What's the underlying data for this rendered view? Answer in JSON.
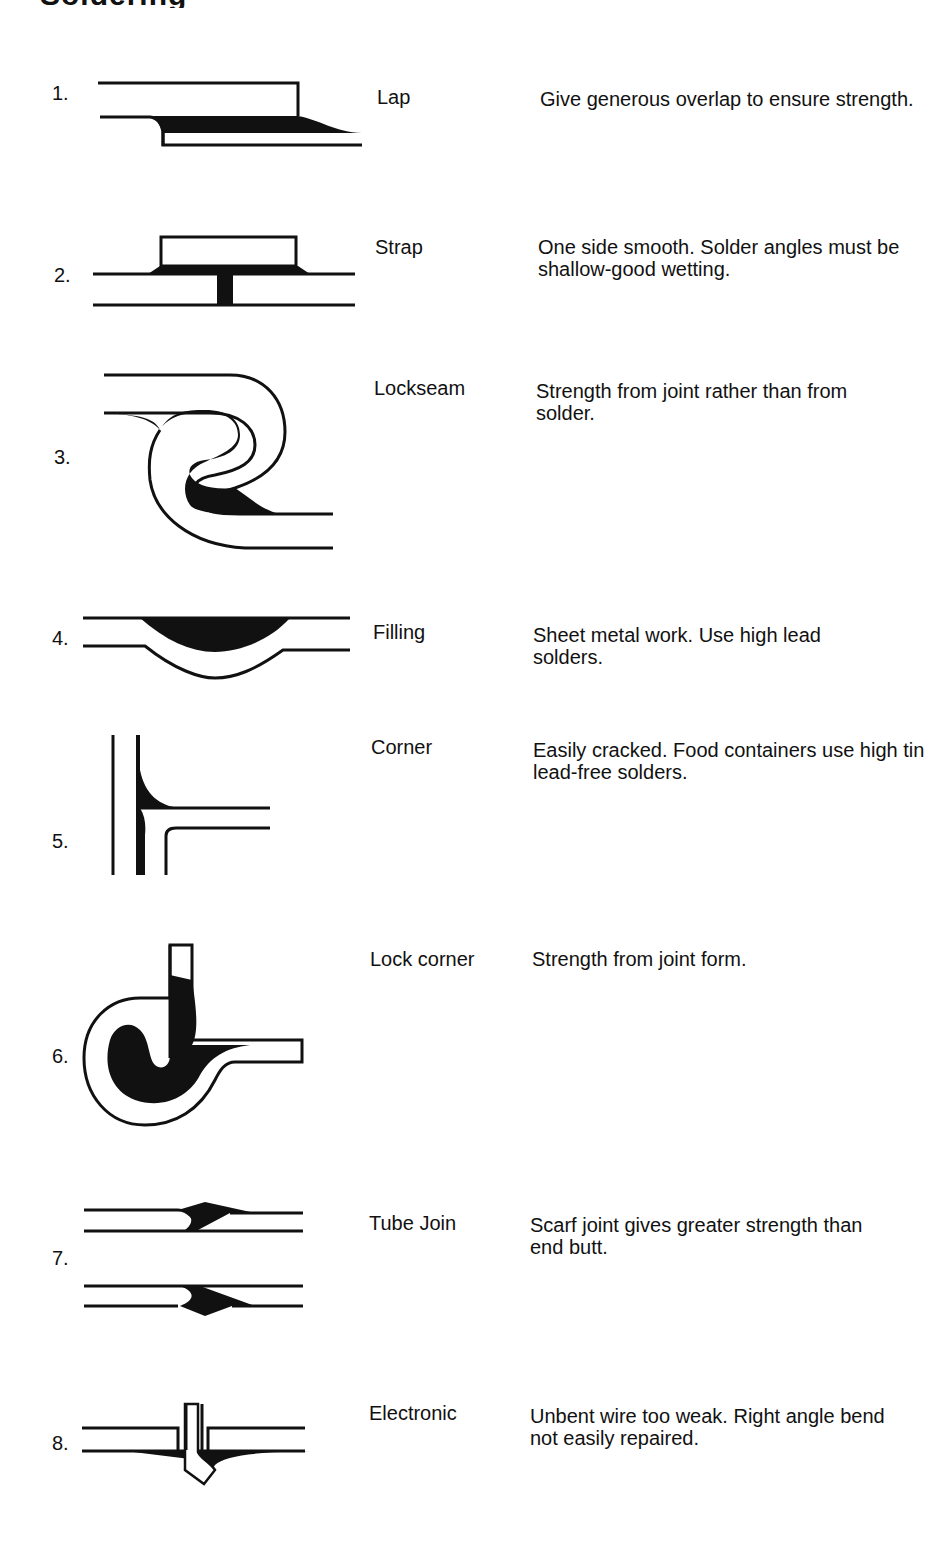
{
  "page": {
    "title_fragment": "Soldering"
  },
  "joints": [
    {
      "number": "1.",
      "name": "Lap",
      "description": "Give generous overlap to ensure strength.",
      "icon": "lap-joint-diagram"
    },
    {
      "number": "2.",
      "name": "Strap",
      "description": "One side smooth. Solder angles must be shallow-good wetting.",
      "icon": "strap-joint-diagram"
    },
    {
      "number": "3.",
      "name": "Lockseam",
      "description": "Strength from joint rather than from solder.",
      "icon": "lockseam-joint-diagram"
    },
    {
      "number": "4.",
      "name": "Filling",
      "description": "Sheet metal work. Use high lead solders.",
      "icon": "filling-joint-diagram"
    },
    {
      "number": "5.",
      "name": "Corner",
      "description": "Easily cracked. Food containers use high tin lead-free solders.",
      "icon": "corner-joint-diagram"
    },
    {
      "number": "6.",
      "name": "Lock corner",
      "description": "Strength from joint form.",
      "icon": "lock-corner-joint-diagram"
    },
    {
      "number": "7.",
      "name": "Tube Join",
      "description": "Scarf joint gives greater strength than end butt.",
      "icon": "tube-join-diagram"
    },
    {
      "number": "8.",
      "name": "Electronic",
      "description": "Unbent wire too weak. Right angle bend not easily repaired.",
      "icon": "electronic-joint-diagram"
    }
  ],
  "colors": {
    "ink": "#111111",
    "paper": "#ffffff"
  }
}
